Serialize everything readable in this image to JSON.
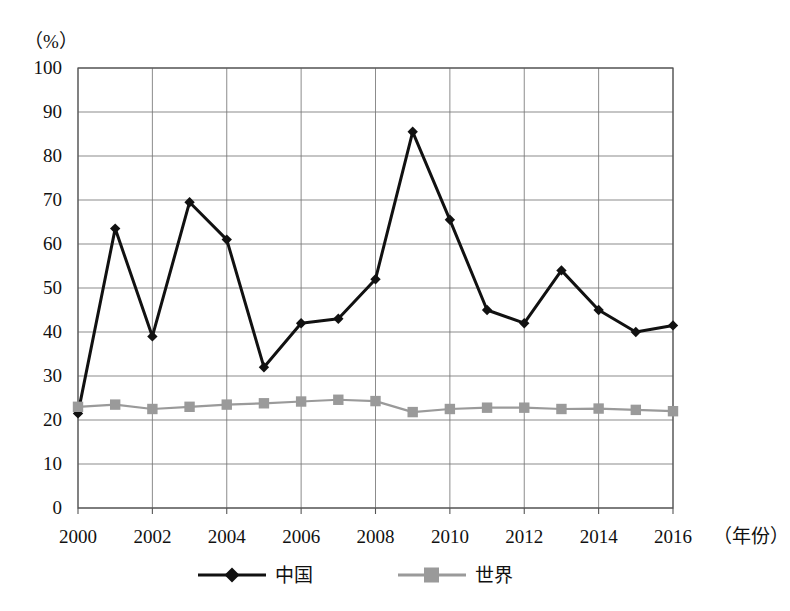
{
  "chart_data": {
    "type": "line",
    "title": "",
    "xlabel": "（年份）",
    "ylabel": "（%）",
    "ylim": [
      0,
      100
    ],
    "xlim": [
      2000,
      2016
    ],
    "grid": true,
    "legend_position": "bottom",
    "x": [
      2000,
      2001,
      2002,
      2003,
      2004,
      2005,
      2006,
      2007,
      2008,
      2009,
      2010,
      2011,
      2012,
      2013,
      2014,
      2015,
      2016
    ],
    "xtick_labels": [
      "2000",
      "2002",
      "2004",
      "2006",
      "2008",
      "2010",
      "2012",
      "2014",
      "2016"
    ],
    "xtick_values": [
      2000,
      2002,
      2004,
      2006,
      2008,
      2010,
      2012,
      2014,
      2016
    ],
    "ytick_labels": [
      "0",
      "10",
      "20",
      "30",
      "40",
      "50",
      "60",
      "70",
      "80",
      "90",
      "100"
    ],
    "ytick_values": [
      0,
      10,
      20,
      30,
      40,
      50,
      60,
      70,
      80,
      90,
      100
    ],
    "series": [
      {
        "name": "中国",
        "color": "#111111",
        "marker": "diamond",
        "values": [
          21.5,
          63.5,
          39.0,
          69.5,
          61.0,
          32.0,
          42.0,
          43.0,
          52.0,
          85.5,
          65.5,
          45.0,
          42.0,
          54.0,
          45.0,
          40.0,
          41.5
        ]
      },
      {
        "name": "世界",
        "color": "#9a9a9a",
        "marker": "square",
        "values": [
          23.0,
          23.5,
          22.5,
          23.0,
          23.5,
          23.8,
          24.2,
          24.6,
          24.3,
          21.8,
          22.5,
          22.8,
          22.8,
          22.5,
          22.6,
          22.3,
          22.0
        ]
      }
    ]
  },
  "axis": {
    "y_unit_label": "（%）",
    "x_unit_label": "（年份）"
  },
  "legend": {
    "entries": [
      {
        "label": "中国",
        "color": "#111111",
        "marker": "diamond"
      },
      {
        "label": "世界",
        "color": "#9a9a9a",
        "marker": "square"
      }
    ]
  },
  "colors": {
    "china": "#111111",
    "world": "#9a9a9a",
    "grid": "#777777",
    "frame": "#555555",
    "background": "#ffffff"
  }
}
